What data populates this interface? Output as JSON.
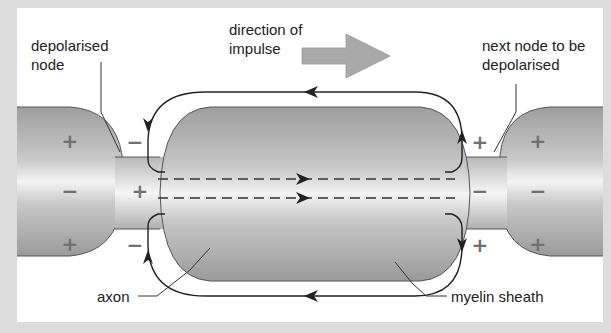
{
  "labels": {
    "depolarised_node": [
      "depolarised",
      "node"
    ],
    "direction": [
      "direction of",
      "impulse"
    ],
    "next_node": [
      "next node to be",
      "depolarised"
    ],
    "axon": "axon",
    "myelin": "myelin sheath"
  },
  "charges": {
    "outer_left": "+",
    "inner_left": "−",
    "node_left_outer": "−",
    "node_left_inner": "+",
    "node_right_outer": "+",
    "node_right_inner": "−",
    "outer_right": "+",
    "inner_right": "−"
  },
  "colors": {
    "background": "#dcdcdc",
    "panel": "#ffffff",
    "myelin": "#a8a8a8",
    "axon_core": "#f2f2f2",
    "arrow_fill": "#a9a9a9",
    "line": "#333333"
  }
}
